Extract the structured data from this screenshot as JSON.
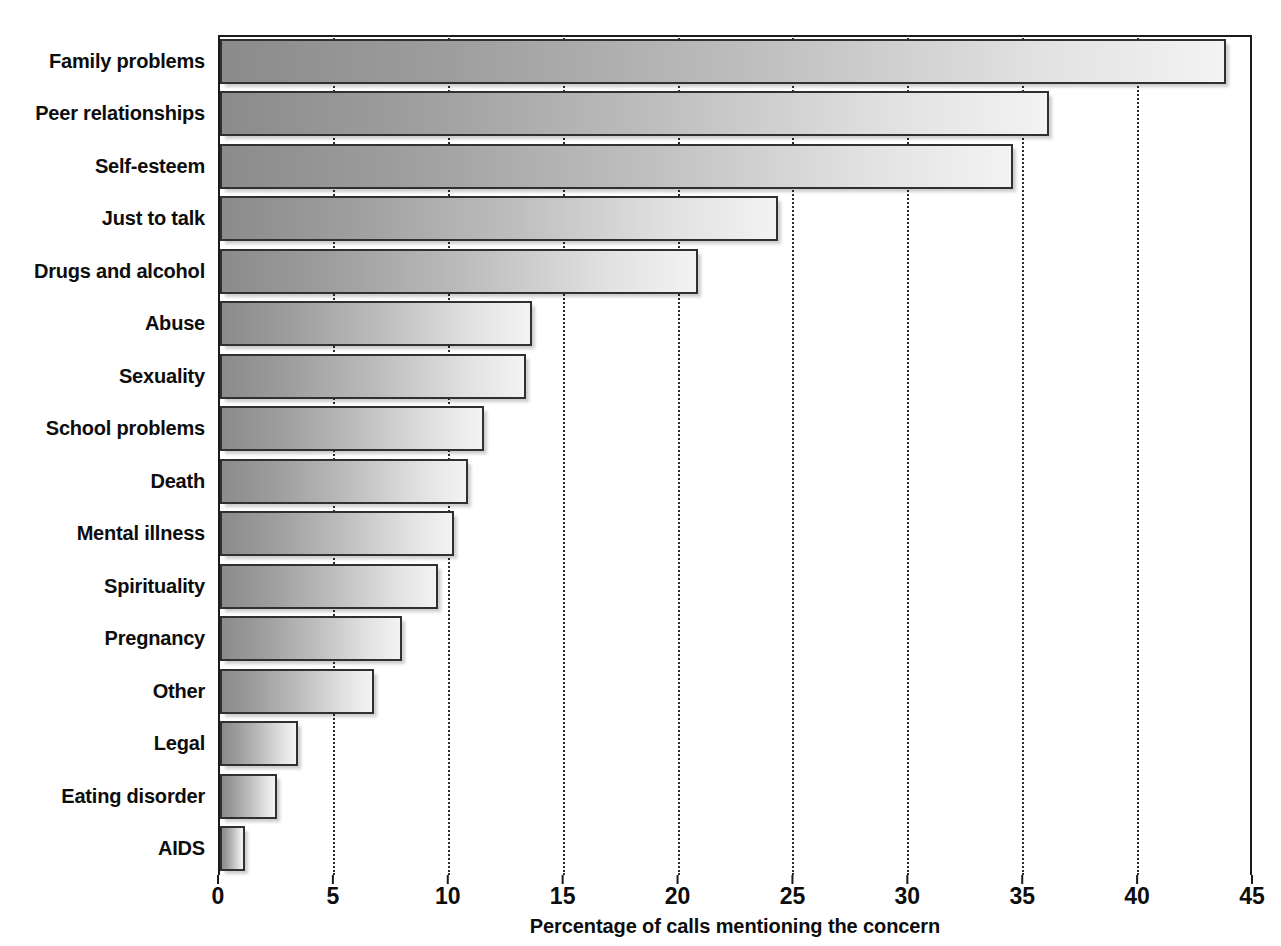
{
  "chart_data": {
    "type": "bar",
    "orientation": "horizontal",
    "title": "",
    "xlabel": "Percentage of calls mentioning the concern",
    "ylabel": "",
    "xlim": [
      0,
      45
    ],
    "xticks": [
      0,
      5,
      10,
      15,
      20,
      25,
      30,
      35,
      40,
      45
    ],
    "xtick_labels": [
      "0",
      "5",
      "10",
      "15",
      "20",
      "25",
      "30",
      "35",
      "40",
      "45"
    ],
    "grid": "vertical-dotted",
    "legend": "none",
    "categories": [
      "Family problems",
      "Peer relationships",
      "Self-esteem",
      "Just to talk",
      "Drugs and alcohol",
      "Abuse",
      "Sexuality",
      "School problems",
      "Death",
      "Mental illness",
      "Spirituality",
      "Pregnancy",
      "Other",
      "Legal",
      "Eating disorder",
      "AIDS"
    ],
    "values": [
      43.8,
      36.1,
      34.5,
      24.3,
      20.8,
      13.6,
      13.3,
      11.5,
      10.8,
      10.2,
      9.5,
      7.9,
      6.7,
      3.4,
      2.5,
      1.1
    ],
    "bar_fill_gradient": [
      "#8b8b8b",
      "#f3f3f3"
    ],
    "bar_border_color": "#303030",
    "axis_color": "#1a1a1a",
    "gridline_color": "#2b2b2b",
    "text_color": "#0d0d0d"
  },
  "top_sliver": {
    "text": ""
  }
}
